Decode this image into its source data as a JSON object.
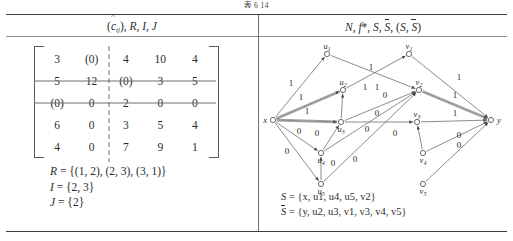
{
  "figure": {
    "caption": "表 6 14"
  },
  "columns": {
    "left_header": {
      "parts": [
        "(ĉ",
        "ij",
        "), R, I, J"
      ],
      "plain": "(ĉij), R, I, J"
    },
    "right_header": {
      "plain": "N, f*, S, S̄, (S, S̄)"
    }
  },
  "left_panel": {
    "matrix": {
      "rows": [
        [
          "3",
          "(0)",
          "4",
          "10",
          "4"
        ],
        [
          "5",
          "12",
          "(0)",
          "3",
          "5"
        ],
        [
          "(0)",
          "0",
          "2",
          "0",
          "0"
        ],
        [
          "6",
          "0",
          "3",
          "5",
          "4"
        ],
        [
          "4",
          "0",
          "7",
          "9",
          "1"
        ]
      ],
      "struck_rows": [
        2,
        3
      ],
      "struck_cols": [
        2
      ],
      "bracket": "square"
    },
    "R_label": "R",
    "R_value": "{(1, 2), (2, 3), (3, 1)}",
    "I_label": "I",
    "I_value": "{2, 3}",
    "J_label": "J",
    "J_value": "{2}",
    "eq": "="
  },
  "right_panel": {
    "nodes": [
      {
        "id": "x",
        "label": "x",
        "sub": "",
        "x": 14,
        "y": 82,
        "label_pos": "left"
      },
      {
        "id": "y",
        "label": "y",
        "sub": "",
        "x": 232,
        "y": 82,
        "label_pos": "right"
      },
      {
        "id": "u1",
        "label": "u",
        "sub": "1",
        "x": 68,
        "y": 16,
        "label_pos": "top"
      },
      {
        "id": "u2",
        "label": "u",
        "sub": "2",
        "x": 84,
        "y": 52,
        "label_pos": "top"
      },
      {
        "id": "u3",
        "label": "u",
        "sub": "3",
        "x": 82,
        "y": 84,
        "label_pos": "bottom"
      },
      {
        "id": "u4",
        "label": "u",
        "sub": "4",
        "x": 62,
        "y": 115,
        "label_pos": "bottom"
      },
      {
        "id": "u5",
        "label": "u",
        "sub": "5",
        "x": 62,
        "y": 146,
        "label_pos": "bottom"
      },
      {
        "id": "v1",
        "label": "v",
        "sub": "1",
        "x": 150,
        "y": 16,
        "label_pos": "top"
      },
      {
        "id": "v2",
        "label": "v",
        "sub": "2",
        "x": 160,
        "y": 52,
        "label_pos": "top"
      },
      {
        "id": "v3",
        "label": "v",
        "sub": "3",
        "x": 158,
        "y": 84,
        "label_pos": "top"
      },
      {
        "id": "v4",
        "label": "v",
        "sub": "4",
        "x": 164,
        "y": 115,
        "label_pos": "bottom"
      },
      {
        "id": "v5",
        "label": "v",
        "sub": "5",
        "x": 164,
        "y": 146,
        "label_pos": "bottom"
      }
    ],
    "edges": [
      {
        "from": "x",
        "to": "u1",
        "label": "1",
        "lx": 32,
        "ly": 48,
        "double": false
      },
      {
        "from": "x",
        "to": "u2",
        "label": "1",
        "lx": 42,
        "ly": 62,
        "double": true
      },
      {
        "from": "x",
        "to": "u3",
        "label": "1",
        "lx": 48,
        "ly": 76,
        "double": true
      },
      {
        "from": "x",
        "to": "u4",
        "label": "0",
        "lx": 40,
        "ly": 96,
        "double": false
      },
      {
        "from": "x",
        "to": "u5",
        "label": "0",
        "lx": 28,
        "ly": 116,
        "double": false
      },
      {
        "from": "u1",
        "to": "v2",
        "label": "1",
        "lx": 112,
        "ly": 32,
        "double": false
      },
      {
        "from": "u2",
        "to": "v1",
        "label": "1",
        "lx": 118,
        "ly": 52,
        "double": false
      },
      {
        "from": "u3",
        "to": "u2",
        "label": "1",
        "lx": 106,
        "ly": 52,
        "double": false
      },
      {
        "from": "u3",
        "to": "v2",
        "label": "0",
        "lx": 126,
        "ly": 60,
        "double": false
      },
      {
        "from": "u3",
        "to": "v3",
        "label": "0",
        "lx": 118,
        "ly": 78,
        "double": false
      },
      {
        "from": "u4",
        "to": "v2",
        "label": "0",
        "lx": 108,
        "ly": 94,
        "double": false
      },
      {
        "from": "u5",
        "to": "v2",
        "label": "0",
        "lx": 96,
        "ly": 124,
        "double": false
      },
      {
        "from": "u4",
        "to": "u3",
        "label": "0",
        "lx": 58,
        "ly": 98,
        "double": false
      },
      {
        "from": "u5",
        "to": "u4",
        "label": "0",
        "lx": 74,
        "ly": 128,
        "double": false
      },
      {
        "from": "v1",
        "to": "y",
        "label": "1",
        "lx": 200,
        "ly": 42,
        "double": false
      },
      {
        "from": "v2",
        "to": "y",
        "label": "1",
        "lx": 196,
        "ly": 60,
        "double": true
      },
      {
        "from": "v3",
        "to": "y",
        "label": "1",
        "lx": 196,
        "ly": 78,
        "double": false
      },
      {
        "from": "v4",
        "to": "y",
        "label": "0",
        "lx": 200,
        "ly": 100,
        "double": false
      },
      {
        "from": "v5",
        "to": "y",
        "label": "0",
        "lx": 200,
        "ly": 110,
        "double": false
      },
      {
        "from": "v4",
        "to": "v3",
        "label": "0",
        "lx": 136,
        "ly": 98,
        "double": false
      }
    ],
    "S_label": "S",
    "S_value": "{x, u1, u4, u5, v2}",
    "Sbar_label": "S̄",
    "Sbar_value": "{y, u2, u3, v1, v3, v4, v5}",
    "eq": "="
  },
  "colors": {
    "ink": "#2b2b2b",
    "rule": "#3c3c3c",
    "thin_rule": "#8d8d8d",
    "graph_line": "#555555",
    "highlight": "#9a9a9a",
    "background": "#ffffff"
  }
}
